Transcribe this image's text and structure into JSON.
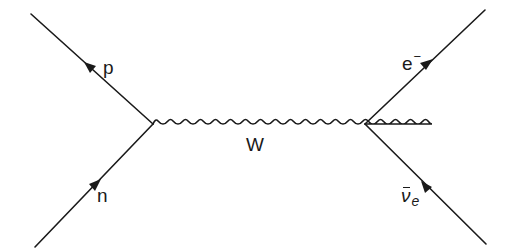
{
  "diagram": {
    "type": "feynman",
    "title": "",
    "process": "beta decay",
    "colors": {
      "line": "#1a1a1a",
      "background": "#ffffff"
    },
    "vertices": [
      {
        "id": "v1",
        "x": 153,
        "y": 124
      },
      {
        "id": "v2",
        "x": 365,
        "y": 124
      }
    ],
    "propagators": [
      {
        "id": "W",
        "type": "wavy",
        "from": "v1",
        "to": "v2",
        "label": "W"
      }
    ],
    "external_lines": [
      {
        "id": "n",
        "label": "n",
        "from": [
          35,
          247
        ],
        "to": "v1",
        "arrow": "toward-vertex"
      },
      {
        "id": "p",
        "label": "p",
        "from": "v1",
        "to": [
          31,
          14
        ],
        "arrow": "away-from-vertex"
      },
      {
        "id": "electron",
        "label_base": "e",
        "label_sup": "−",
        "from": "v2",
        "to": [
          485,
          10
        ],
        "arrow": "away-from-vertex"
      },
      {
        "id": "antineutrino",
        "label_base": "ν",
        "label_sub": "e",
        "from": "v2",
        "to": [
          486,
          244
        ],
        "arrow": "toward-vertex",
        "overbar": true
      }
    ]
  },
  "labels": {
    "p": "p",
    "n": "n",
    "w": "W",
    "e_base": "e",
    "e_sup": "−",
    "nu_base": "ν",
    "nu_sub": "e"
  }
}
